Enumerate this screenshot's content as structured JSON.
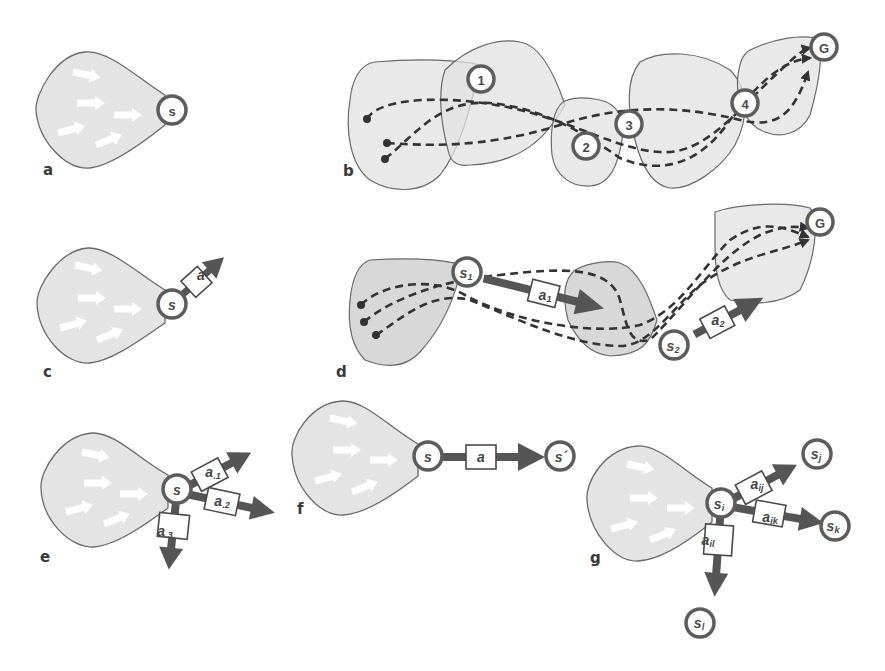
{
  "figure": {
    "panels": {
      "a": {
        "label": "a",
        "state": "s"
      },
      "b": {
        "label": "b",
        "subgoals": [
          "1",
          "2",
          "3",
          "4"
        ],
        "goal": "G"
      },
      "c": {
        "label": "c",
        "state": "s",
        "action": "a"
      },
      "d": {
        "label": "d",
        "state1": "s",
        "state1_sub": "1",
        "action1": "a",
        "action1_sub": "1",
        "state2": "s",
        "state2_sub": "2",
        "action2": "a",
        "action2_sub": "2",
        "goal": "G"
      },
      "e": {
        "label": "e",
        "state": "s",
        "actions": [
          {
            "base": "a",
            "sub": ".1"
          },
          {
            "base": "a",
            "sub": ".2"
          },
          {
            "base": "a",
            "sub": ".3"
          }
        ]
      },
      "f": {
        "label": "f",
        "state": "s",
        "action": "a",
        "next_state": "s´"
      },
      "g": {
        "label": "g",
        "state": "s",
        "state_sub": "i",
        "actions": [
          {
            "base": "a",
            "sub": "ij"
          },
          {
            "base": "a",
            "sub": "ik"
          },
          {
            "base": "a",
            "sub": "il"
          }
        ],
        "targets": [
          {
            "base": "s",
            "sub": "j"
          },
          {
            "base": "s",
            "sub": "k"
          },
          {
            "base": "s",
            "sub": "l"
          }
        ]
      }
    },
    "colors": {
      "region_fill": "#e4e4e4",
      "region_stroke": "#6a6a6a",
      "node_stroke": "#5c5c5c",
      "arrow": "#555555",
      "path": "#333333"
    }
  }
}
